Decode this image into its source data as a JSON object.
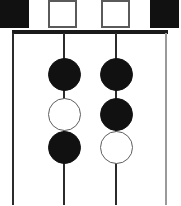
{
  "diagram": {
    "background_color": "#ffffff",
    "line_color": "#1a1a1a",
    "filled_color": "#111111",
    "open_color": "#ffffff",
    "open_border_color": "#5a5a5a",
    "width": 181,
    "height": 206
  },
  "parent_generation": {
    "label": "parent row",
    "symbols": [
      {
        "name": "parent-square-1",
        "shape": "square",
        "fill": "filled",
        "x": 0,
        "y": 0,
        "size": 29
      },
      {
        "name": "parent-square-2",
        "shape": "square",
        "fill": "open",
        "x": 48,
        "y": 0,
        "size": 29
      },
      {
        "name": "parent-square-3",
        "shape": "square",
        "fill": "open",
        "x": 101,
        "y": 0,
        "size": 29
      },
      {
        "name": "parent-square-4",
        "shape": "square",
        "fill": "filled",
        "x": 150,
        "y": 0,
        "size": 29
      }
    ]
  },
  "sibship_bar": {
    "name": "sibship-line",
    "x": 12,
    "y": 30,
    "width": 156,
    "height": 4
  },
  "descent_lines": [
    {
      "name": "descent-line-1",
      "x": 12,
      "y": 33,
      "height": 172,
      "weight": "heavy"
    },
    {
      "name": "descent-line-2",
      "x": 63,
      "y": 33,
      "height": 172,
      "weight": "heavy"
    },
    {
      "name": "descent-line-3",
      "x": 115,
      "y": 33,
      "height": 172,
      "weight": "heavy"
    },
    {
      "name": "descent-line-4",
      "x": 165,
      "y": 33,
      "height": 172,
      "weight": "light"
    }
  ],
  "offspring_columns": [
    {
      "name": "offspring-column-left",
      "center_x": 64,
      "circles": [
        {
          "name": "offspring-circle-l1",
          "fill": "filled",
          "center_y": 74,
          "diameter": 33
        },
        {
          "name": "offspring-circle-l2",
          "fill": "open",
          "center_y": 114,
          "diameter": 33
        },
        {
          "name": "offspring-circle-l3",
          "fill": "filled",
          "center_y": 147,
          "diameter": 33
        }
      ]
    },
    {
      "name": "offspring-column-right",
      "center_x": 116,
      "circles": [
        {
          "name": "offspring-circle-r1",
          "fill": "filled",
          "center_y": 74,
          "diameter": 33
        },
        {
          "name": "offspring-circle-r2",
          "fill": "filled",
          "center_y": 114,
          "diameter": 33
        },
        {
          "name": "offspring-circle-r3",
          "fill": "open",
          "center_y": 147,
          "diameter": 33
        }
      ]
    }
  ]
}
